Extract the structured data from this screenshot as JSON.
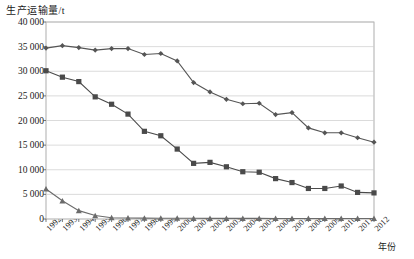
{
  "chart_data": {
    "type": "line",
    "title": "",
    "ylabel": "生产运输量/t",
    "xlabel": "年份",
    "ylim": [
      0,
      40000
    ],
    "ytick_labels": [
      "0",
      "5 000",
      "10 000",
      "15 000",
      "20 000",
      "25 000",
      "30 000",
      "35 000",
      "40 000"
    ],
    "ytick_values": [
      0,
      5000,
      10000,
      15000,
      20000,
      25000,
      30000,
      35000,
      40000
    ],
    "grid": true,
    "legend_position": "inline-annotation",
    "categories": [
      "1992",
      "1993",
      "1994",
      "1995",
      "1996",
      "1997",
      "1998",
      "1999",
      "2000",
      "2001",
      "2002",
      "2003",
      "2004",
      "2005",
      "2006",
      "2007",
      "2008",
      "2009",
      "2010",
      "2011",
      "2012"
    ],
    "series": [
      {
        "name": "三氯乙烯",
        "marker": "diamond",
        "color": "#555555",
        "values": [
          34700,
          35200,
          34800,
          34300,
          34600,
          34600,
          33400,
          33600,
          32100,
          27700,
          25800,
          24300,
          23400,
          23500,
          21200,
          21600,
          18500,
          17500,
          17500,
          16500,
          15600
        ]
      },
      {
        "name": "四氯乙烯",
        "marker": "square",
        "color": "#4a4a4a",
        "values": [
          30100,
          28800,
          27900,
          24800,
          23300,
          21300,
          17800,
          16900,
          14200,
          11300,
          11500,
          10600,
          9600,
          9500,
          8200,
          7400,
          6200,
          6200,
          6700,
          5400,
          5300
        ]
      },
      {
        "name": "四氯化碳",
        "marker": "triangle",
        "color": "#6b6b6b",
        "values": [
          6100,
          3700,
          1700,
          700,
          250,
          200,
          180,
          160,
          150,
          140,
          130,
          130,
          120,
          120,
          110,
          110,
          100,
          100,
          100,
          100,
          100
        ]
      }
    ]
  },
  "annotations": [
    {
      "name": "三氯乙烯",
      "x_pct": 0.54,
      "y_value": 25500
    },
    {
      "name": "四氯乙烯",
      "x_pct": 0.3,
      "y_value": 13400
    },
    {
      "name": "四氯化碳",
      "x_pct": 0.175,
      "y_value": 4200
    }
  ]
}
